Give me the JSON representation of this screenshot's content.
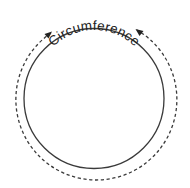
{
  "diagram": {
    "title": "Circumference",
    "label_text": "Circumference",
    "shapes": {
      "circle": {
        "cx": 94,
        "cy": 98.5,
        "r": 70,
        "stroke": "#3a3a3a",
        "style": "solid"
      },
      "measure_arc": {
        "r": 80.5,
        "stroke": "#3a3a3a",
        "style": "dashed",
        "arrowheads": 2,
        "arrow_direction": "toward label"
      }
    },
    "colors": {
      "background": "#ffffff",
      "line": "#3a3a3a",
      "text": "#222222"
    }
  }
}
